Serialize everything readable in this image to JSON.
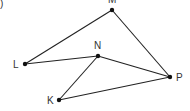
{
  "diagram": {
    "type": "geometry-figure",
    "partial_label": ")",
    "colors": {
      "line": "#222222",
      "point": "#111111",
      "text": "#333333"
    },
    "points": [
      {
        "id": "M",
        "label": "M"
      },
      {
        "id": "L",
        "label": "L"
      },
      {
        "id": "N",
        "label": "N"
      },
      {
        "id": "P",
        "label": "P"
      },
      {
        "id": "K",
        "label": "K"
      }
    ],
    "edges": [
      [
        "L",
        "M"
      ],
      [
        "M",
        "P"
      ],
      [
        "L",
        "N"
      ],
      [
        "N",
        "P"
      ],
      [
        "N",
        "K"
      ],
      [
        "K",
        "P"
      ]
    ]
  }
}
